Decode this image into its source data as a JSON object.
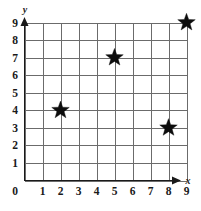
{
  "chart_data": {
    "type": "scatter",
    "title": "",
    "subtitle": "",
    "xlabel": "x",
    "ylabel": "y",
    "xlim": [
      0,
      9
    ],
    "ylim": [
      0,
      9
    ],
    "grid": true,
    "legend": null,
    "legend_position": "none",
    "marker": "star",
    "marker_color": "#0d0d0d",
    "grid_color": "#6b6b6b",
    "axis_color": "#1a1a1a",
    "background_color": "#ffffff",
    "x_ticks": [
      "0",
      "1",
      "2",
      "3",
      "4",
      "5",
      "6",
      "7",
      "8",
      "9"
    ],
    "y_ticks": [
      "0",
      "1",
      "2",
      "3",
      "4",
      "5",
      "6",
      "7",
      "8",
      "9"
    ],
    "x": [
      2,
      5,
      8,
      9
    ],
    "y": [
      4,
      7,
      3,
      9
    ],
    "points": [
      {
        "label": "point-1",
        "x": 2,
        "y": 4
      },
      {
        "label": "point-2",
        "x": 5,
        "y": 7
      },
      {
        "label": "point-3",
        "x": 8,
        "y": 3
      },
      {
        "label": "point-4",
        "x": 9,
        "y": 9
      }
    ]
  }
}
